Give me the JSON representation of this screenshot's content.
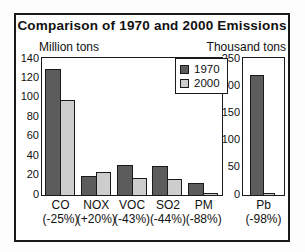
{
  "title": "Comparison of 1970 and 2000 Emissions",
  "colors": {
    "bar_1970": "#5c5c5c",
    "bar_2000": "#cdcdcd",
    "outline": "#1a1a1a",
    "background": "#ffffff"
  },
  "legend": {
    "items": [
      {
        "label": "1970",
        "color": "#5c5c5c"
      },
      {
        "label": "2000",
        "color": "#cdcdcd"
      }
    ]
  },
  "chart_data": [
    {
      "type": "bar",
      "title": "Comparison of 1970 and 2000 Emissions",
      "unit_label": "Million tons",
      "categories": [
        "CO",
        "NOX",
        "VOC",
        "SO2",
        "PM"
      ],
      "category_sublabels": [
        "(-25%)",
        "(+20%)",
        "(-43%)",
        "(-44%)",
        "(-88%)"
      ],
      "series": [
        {
          "name": "1970",
          "values": [
            130,
            20,
            31,
            30,
            12
          ],
          "color": "#5c5c5c"
        },
        {
          "name": "2000",
          "values": [
            98,
            24,
            18,
            17,
            2
          ],
          "color": "#cdcdcd"
        }
      ],
      "ylim": [
        0,
        140
      ],
      "ytick_step": 20,
      "yticks": [
        140,
        120,
        100,
        80,
        60,
        40,
        20,
        0
      ],
      "grid": false,
      "legend_position": "top-right"
    },
    {
      "type": "bar",
      "unit_label": "Thousand tons",
      "categories": [
        "Pb"
      ],
      "category_sublabels": [
        "(-98%)"
      ],
      "series": [
        {
          "name": "1970",
          "values": [
            220
          ],
          "color": "#5c5c5c"
        },
        {
          "name": "2000",
          "values": [
            4
          ],
          "color": "#cdcdcd"
        }
      ],
      "ylim": [
        0,
        250
      ],
      "ytick_step": 50,
      "yticks": [
        250,
        200,
        150,
        100,
        50,
        0
      ],
      "grid": false,
      "legend_position": "none"
    }
  ]
}
